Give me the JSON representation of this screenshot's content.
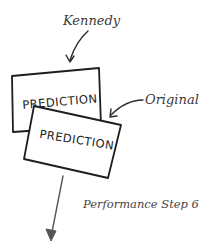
{
  "diagram": {
    "labels": {
      "kennedy": "Kennedy",
      "original": "Original",
      "step": "Performance Step 6"
    },
    "cards": [
      {
        "id": "back",
        "text": "PREDICTION"
      },
      {
        "id": "front",
        "text": "PREDICTION"
      }
    ],
    "colors": {
      "ink": "#1e1e1e",
      "label": "#3a3a3a",
      "arrow_gray": "#555555",
      "background": "#ffffff"
    }
  }
}
